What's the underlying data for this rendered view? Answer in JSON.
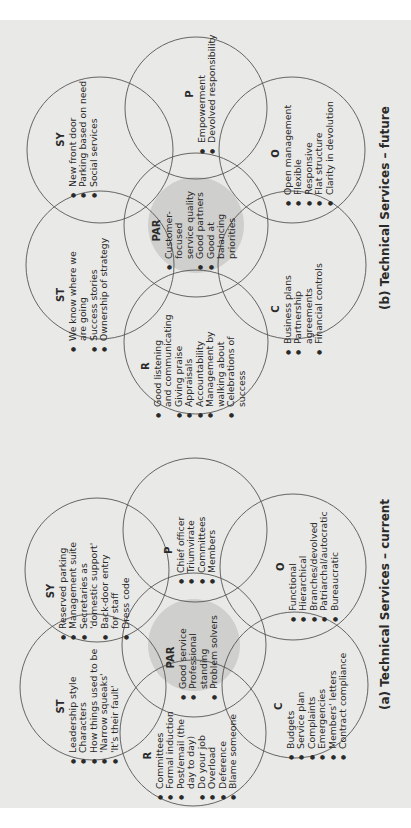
{
  "diagrams": {
    "future": {
      "caption": "(b) Technical Services – future",
      "SY": {
        "title": "SY",
        "items": [
          "New front door",
          "Parking based on need",
          "Social services"
        ]
      },
      "P": {
        "title": "P",
        "items": [
          "Empowerment",
          "Devolved responsibility"
        ]
      },
      "O": {
        "title": "O",
        "items": [
          "Open management",
          "Flexible",
          "Responsive",
          "Flat structure",
          "Clarity in devolution"
        ]
      },
      "PAR": {
        "title": "PAR",
        "items": [
          "Customer-\nfocused\nservice quality",
          "Good partners",
          "Good at\nbalancing\npriorities"
        ]
      },
      "ST": {
        "title": "ST",
        "items": [
          "We know where we\nare going",
          "Success stories",
          "Ownership of strategy"
        ]
      },
      "C": {
        "title": "C",
        "items": [
          "Business plans",
          "Partnership\nagreements",
          "Financial controls"
        ]
      },
      "R": {
        "title": "R",
        "items": [
          "Good listening\nand communicating",
          "Giving praise",
          "Appraisals",
          "Accountability",
          "Management by\nwalking about",
          "Celebrations of\nsuccess"
        ]
      }
    },
    "current": {
      "caption": "(a) Technical Services – current",
      "SY": {
        "title": "SY",
        "items": [
          "Reserved parking",
          "Management suite",
          "Secretaries as\n'domestic support'",
          "Back-door entry\nfor staff",
          "Dress code"
        ]
      },
      "P": {
        "title": "P",
        "items": [
          "Chief officer",
          "Triumvirate",
          "Committees",
          "Members"
        ]
      },
      "O": {
        "title": "O",
        "items": [
          "Functional",
          "Hierarchical",
          "Branches/devolved",
          "Patriarchal/autocratic",
          "Bureaucratic"
        ]
      },
      "PAR": {
        "title": "PAR",
        "items": [
          "Good service",
          "Professional\nstanding",
          "Problem solvers"
        ]
      },
      "ST": {
        "title": "ST",
        "items": [
          "Leadership style",
          "Characters",
          "How things used to be",
          "'Narrow squeaks'",
          "'It's their fault'"
        ]
      },
      "C": {
        "title": "C",
        "items": [
          "Budgets",
          "Service plan",
          "Complaints",
          "Emergencies",
          "Members' letters",
          "Contract compliance"
        ]
      },
      "R": {
        "title": "R",
        "items": [
          "Committees",
          "Formal induction",
          "Post/email (the\nday to day)",
          "Do your job",
          "Overload",
          "Deference",
          "Blame someone"
        ]
      }
    }
  },
  "colors": {
    "page": "#e9e9e7",
    "paradigm_fill": "#cfcfcd",
    "stroke": "#555555"
  }
}
